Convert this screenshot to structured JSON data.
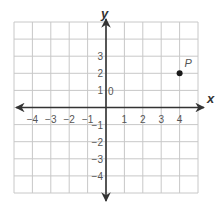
{
  "chart_data": {
    "type": "scatter",
    "title": "",
    "xlabel": "x",
    "ylabel": "y",
    "xlim": [
      -5,
      5
    ],
    "ylim": [
      -5,
      5
    ],
    "grid": true,
    "x_ticks": [
      -4,
      -3,
      -2,
      -1,
      1,
      2,
      3,
      4
    ],
    "y_ticks": [
      3,
      2,
      1,
      -1,
      -2,
      -3,
      -4
    ],
    "origin_label": "0",
    "points": [
      {
        "label": "P",
        "x": 4,
        "y": 2
      }
    ],
    "colors": {
      "grid": "#c8c8c8",
      "axis": "#333333",
      "point": "#1a1a1a",
      "text": "#555555"
    }
  }
}
